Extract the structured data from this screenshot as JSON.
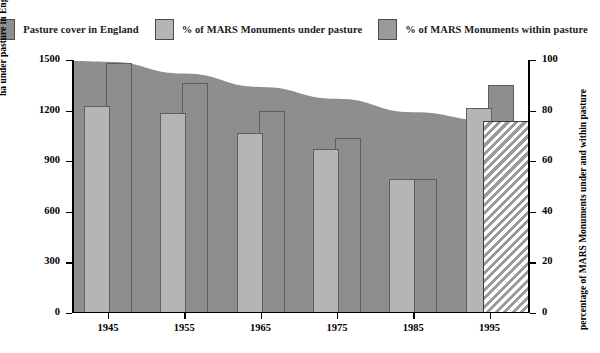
{
  "legend": {
    "items": [
      {
        "label": "Pasture cover in England",
        "swatch": "#8e8e8e",
        "icon": "legend-swatch-icon"
      },
      {
        "label": "% of MARS Monuments under pasture",
        "swatch": "#b5b5b5",
        "icon": "legend-swatch-icon"
      },
      {
        "label": "% of MARS Monuments within pasture",
        "swatch": "#9a9a9a",
        "icon": "legend-swatch-icon"
      }
    ]
  },
  "axes": {
    "left_title": "ha under pasture in England (000s)",
    "right_title": "percentage of MARS Monuments under and within pasture",
    "left_ticks": [
      "0",
      "300",
      "600",
      "900",
      "1200",
      "1500"
    ],
    "right_ticks": [
      "0",
      "20",
      "40",
      "60",
      "80",
      "100"
    ],
    "x_ticks": [
      "1945",
      "1955",
      "1965",
      "1975",
      "1985",
      "1995"
    ]
  },
  "colors": {
    "area": "#8e8e8e",
    "bar_under": "#b5b5b5",
    "bar_within": "#8e8e8e",
    "outline": "#5e5e5e",
    "axis": "#000000",
    "hatch": "#9a9a9a"
  },
  "chart_data": {
    "type": "bar",
    "title": "",
    "subtitle": "",
    "categories": [
      "1945",
      "1955",
      "1965",
      "1975",
      "1985",
      "1995"
    ],
    "xlabel": "",
    "ylabel": "ha under pasture in England (000s)",
    "ylabel_secondary": "percentage of MARS Monuments under and within pasture",
    "ylim": [
      0,
      1500
    ],
    "ylim_secondary": [
      0,
      100
    ],
    "grid": false,
    "legend_position": "top",
    "series": [
      {
        "name": "Pasture cover in England",
        "type": "area",
        "axis": "left",
        "unit": "000s ha",
        "values": [
          1490,
          1420,
          1340,
          1270,
          1190,
          1140
        ]
      },
      {
        "name": "% of MARS Monuments under pasture",
        "type": "bar",
        "axis": "right",
        "unit": "percent",
        "values": [
          82,
          79,
          71,
          65,
          53,
          81
        ]
      },
      {
        "name": "% of MARS Monuments within pasture",
        "type": "bar",
        "axis": "right",
        "unit": "percent",
        "values": [
          99,
          91,
          80,
          69,
          53,
          90
        ]
      }
    ],
    "annotations": [
      {
        "name": "hatched-projection-block",
        "value": 76,
        "axis": "right",
        "after_category": "1995"
      }
    ]
  }
}
